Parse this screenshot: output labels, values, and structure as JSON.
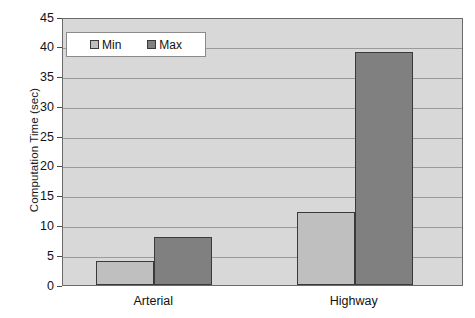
{
  "chart_data": {
    "type": "bar",
    "title": "",
    "xlabel": "",
    "ylabel": "Computation Time (sec)",
    "categories": [
      "Arterial",
      "Highway"
    ],
    "series": [
      {
        "name": "Min",
        "values": [
          4.1,
          12.2
        ],
        "color": "#bfbfbf"
      },
      {
        "name": "Max",
        "values": [
          8.1,
          39.2
        ],
        "color": "#808080"
      }
    ],
    "ylim": [
      0,
      45
    ],
    "ytick_step": 5,
    "yticks": [
      45,
      40,
      35,
      30,
      25,
      20,
      15,
      10,
      5,
      0
    ],
    "ytick_labels": [
      "45",
      "40",
      "35",
      "30",
      "25",
      "20",
      "15",
      "10",
      "5",
      "0"
    ],
    "grid": true,
    "grid_axis": "y",
    "legend_position": "top-left",
    "legend_entries": [
      "Min",
      "Max"
    ],
    "plot_background": "#d8d8d8",
    "figure_background": "#ffffff",
    "axis_color": "#6a6a6a",
    "gridline_color": "#9a9a9a"
  }
}
